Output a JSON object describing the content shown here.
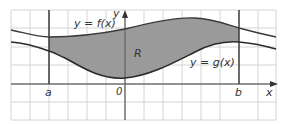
{
  "diagram": {
    "labels": {
      "f_curve": "y = f(x)",
      "g_curve": "y = g(x)",
      "region": "R",
      "x_axis": "x",
      "y_axis": "y",
      "origin": "0",
      "a": "a",
      "b": "b"
    },
    "colors": {
      "background": "#ffffff",
      "grid": "#d4d4d4",
      "axis": "#6e6e6e",
      "curve": "#3a3a3a",
      "bound_line": "#3a3a3a",
      "region_fill": "#9a9a9a"
    }
  }
}
